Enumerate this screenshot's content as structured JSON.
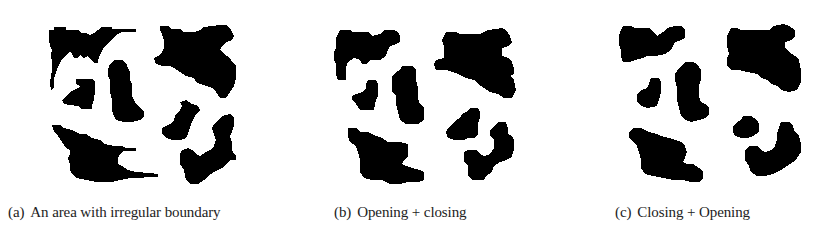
{
  "figure": {
    "panels": [
      {
        "id": "a",
        "label": "(a)",
        "caption": "An area with irregular boundary",
        "caption_left": 8
      },
      {
        "id": "b",
        "label": "(b)",
        "caption": "Opening + closing",
        "caption_left": 334
      },
      {
        "id": "c",
        "label": "(c)",
        "caption": "Closing + Opening",
        "caption_left": 615
      }
    ],
    "colors": {
      "foreground": "#000000",
      "background": "#ffffff",
      "caption_text": "#222222"
    }
  }
}
